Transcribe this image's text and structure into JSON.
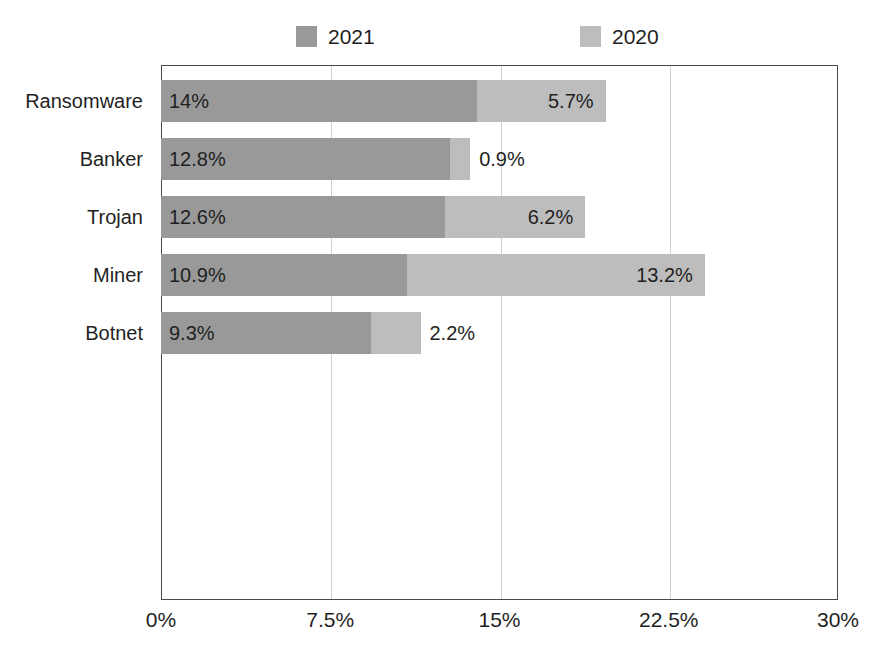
{
  "chart_data": {
    "type": "bar",
    "orientation": "horizontal",
    "stacked": true,
    "title": "",
    "subtitle": "",
    "xlabel": "",
    "ylabel": "",
    "categories": [
      "Ransomware",
      "Banker",
      "Trojan",
      "Miner",
      "Botnet"
    ],
    "series": [
      {
        "name": "2021",
        "color": "#999999",
        "values": [
          14,
          12.8,
          12.6,
          10.9,
          9.3
        ],
        "value_labels": [
          "14%",
          "12.8%",
          "12.6%",
          "10.9%",
          "9.3%"
        ]
      },
      {
        "name": "2020",
        "color": "#bdbdbd",
        "values": [
          5.7,
          0.9,
          6.2,
          13.2,
          2.2
        ],
        "value_labels": [
          "5.7%",
          "0.9%",
          "6.2%",
          "13.2%",
          "2.2%"
        ]
      }
    ],
    "totals": [
      19.7,
      13.7,
      18.8,
      24.1,
      11.5
    ],
    "xlim": [
      0,
      30
    ],
    "xticks": [
      0,
      7.5,
      15,
      22.5,
      30
    ],
    "xtick_labels": [
      "0%",
      "7.5%",
      "15%",
      "22.5%",
      "30%"
    ],
    "grid": "vertical",
    "legend_position": "top",
    "legend": [
      {
        "label": "2021",
        "color": "#999999"
      },
      {
        "label": "2020",
        "color": "#bdbdbd"
      }
    ]
  },
  "colors": {
    "series_2021": "#999999",
    "series_2020": "#bdbdbd",
    "axis": "#4a4a4a",
    "grid": "#d0d0d0",
    "text": "#1f1f1f",
    "background": "#ffffff"
  }
}
